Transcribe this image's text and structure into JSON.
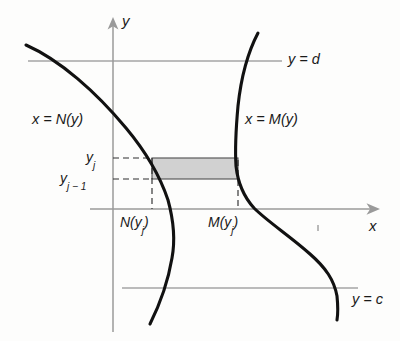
{
  "figure": {
    "background_color": "#fdfdfc",
    "curve_color": "#111111",
    "axis_color": "#8a8a8a",
    "guide_color": "#6f6f6f",
    "dashed_color": "#3a3a3a",
    "rect_fill": "#cfcfcf",
    "rect_stroke": "#555555"
  },
  "axes": {
    "y_axis_label": "y",
    "x_axis_label": "x",
    "y_axis_x_px": 113,
    "x_axis_y_px": 209
  },
  "curves": {
    "left": {
      "label_prefix": "x = ",
      "label_func": "N",
      "label_arg": "(y)",
      "label_full": "x = N(y)"
    },
    "right": {
      "label_prefix": "x = ",
      "label_func": "M",
      "label_arg": "(y)",
      "label_full": "x = M(y)"
    }
  },
  "level_lines": {
    "top": {
      "label_var": "y",
      "label_eq": " = ",
      "label_val": "d",
      "label_full": "y = d"
    },
    "bottom": {
      "label_var": "y",
      "label_eq": " = ",
      "label_val": "c",
      "label_full": "y = c"
    }
  },
  "tick_labels": {
    "y_upper_base": "y",
    "y_upper_sub": "j",
    "y_upper_full": "y_j",
    "y_lower_base": "y",
    "y_lower_sub": "j − 1",
    "y_lower_full": "y_(j-1)",
    "x_left_base": "N(y",
    "x_left_sub": "j",
    "x_left_close": ")",
    "x_left_full": "N(y_j)",
    "x_right_base": "M(y",
    "x_right_sub": "j",
    "x_right_close": ")",
    "x_right_full": "M(y_j)"
  },
  "rectangle": {
    "left_px": 152,
    "right_px": 238,
    "top_px": 158,
    "bottom_px": 179,
    "fill": "#cfcfcf"
  },
  "stray_mark": {
    "present": true,
    "x_px": 318,
    "y_px": 228
  }
}
